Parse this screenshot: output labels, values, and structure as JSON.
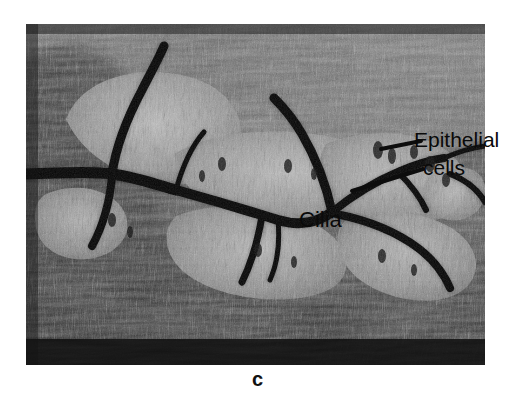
{
  "figure": {
    "kind": "light-micrograph",
    "panel_letter": "c",
    "background_color": "#ffffff",
    "plate": {
      "x": 26,
      "y": 24,
      "width": 459,
      "height": 341,
      "palette": {
        "darkest": "#000000",
        "dark": "#1c1c1c",
        "mid_dark": "#3a3a3a",
        "mid": "#6b6b6b",
        "light": "#a9a9a9",
        "lightest": "#d6d6d6"
      }
    },
    "annotations": [
      {
        "id": "epithelial",
        "line1": "Epithelial",
        "line2": "cells",
        "x": 414,
        "y": 129,
        "font_size": 21,
        "color": "#0a0a0a",
        "has_leader": true
      },
      {
        "id": "cilia",
        "text": "Cilia",
        "x": 299,
        "y": 209,
        "font_size": 22,
        "color": "#0a0a0a",
        "has_leader": false
      }
    ],
    "labels": {
      "epithelial_line1": "Epithelial",
      "epithelial_line2": "cells",
      "cilia": "Cilia",
      "panel": "c"
    },
    "leaders": [
      {
        "id": "leader-epithelial-upper",
        "x1": 421,
        "y1": 141,
        "x2": 381,
        "y2": 149,
        "color": "#0d0d0d",
        "width": 4
      },
      {
        "id": "leader-epithelial-lower",
        "x1": 423,
        "y1": 169,
        "x2": 352,
        "y2": 191,
        "color": "#0d0d0d",
        "width": 4
      }
    ]
  }
}
